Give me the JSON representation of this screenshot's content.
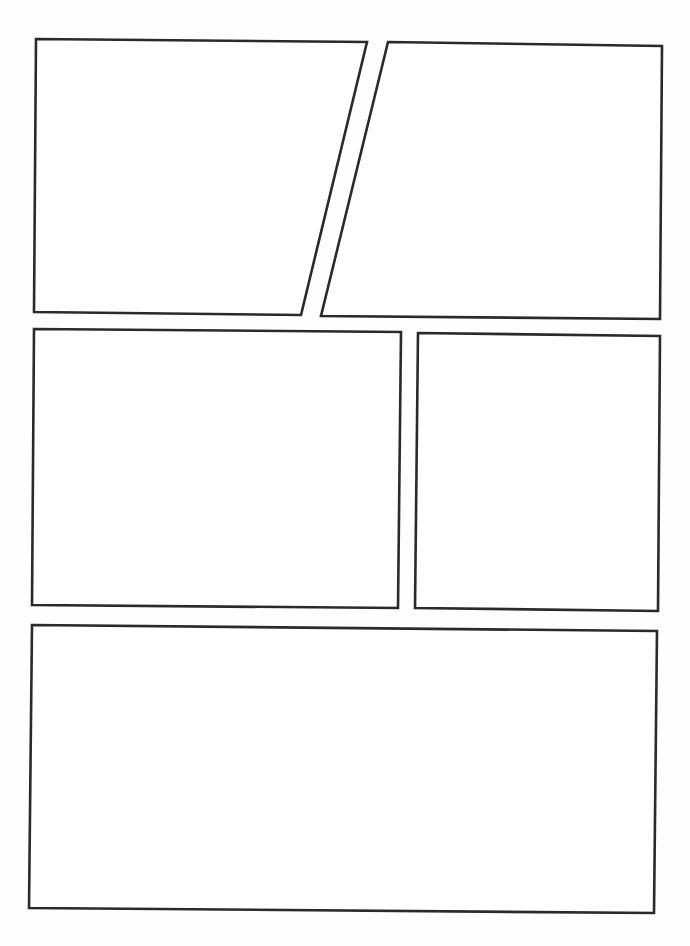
{
  "page": {
    "width": 690,
    "height": 946,
    "background": "#fefefe",
    "panel_fill": "#ffffff",
    "border_color": "#2a2a2a"
  },
  "panels": [
    {
      "id": "panel-1",
      "points": [
        [
          36,
          39
        ],
        [
          367,
          42
        ],
        [
          301,
          315
        ],
        [
          34,
          312
        ]
      ]
    },
    {
      "id": "panel-2",
      "points": [
        [
          388,
          42
        ],
        [
          662,
          46
        ],
        [
          660,
          319
        ],
        [
          321,
          316
        ]
      ]
    },
    {
      "id": "panel-3",
      "points": [
        [
          34,
          329
        ],
        [
          401,
          332
        ],
        [
          398,
          608
        ],
        [
          32,
          605
        ]
      ]
    },
    {
      "id": "panel-4",
      "points": [
        [
          418,
          333
        ],
        [
          660,
          336
        ],
        [
          658,
          611
        ],
        [
          415,
          608
        ]
      ]
    },
    {
      "id": "panel-5",
      "points": [
        [
          32,
          625
        ],
        [
          657,
          631
        ],
        [
          654,
          913
        ],
        [
          29,
          908
        ]
      ]
    }
  ]
}
